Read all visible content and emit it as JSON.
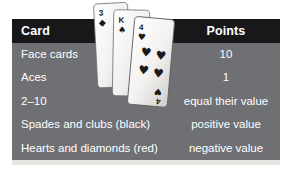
{
  "table": {
    "headers": {
      "card": "Card",
      "points": "Points"
    },
    "rows": [
      {
        "card": "Face cards",
        "points": "10"
      },
      {
        "card": "Aces",
        "points": "1"
      },
      {
        "card": "2–10",
        "points": "equal their value"
      },
      {
        "card": "Spades and clubs (black)",
        "points": "positive value"
      },
      {
        "card": "Hearts and diamonds (red)",
        "points": "negative value"
      }
    ]
  },
  "illustration": {
    "name": "playing-card-stack",
    "cards": [
      {
        "rank": "3",
        "suit": "diamond-pip",
        "suit_glyph": "♦"
      },
      {
        "rank": "K",
        "suit": "spade-pip",
        "suit_glyph": "♠"
      },
      {
        "rank": "4",
        "suit": "heart-pip",
        "suit_glyph": "♥",
        "center_pips": 4
      }
    ]
  },
  "colors": {
    "header_background": "#18181a",
    "row_background": "#6f7073",
    "text": "#ffffff",
    "grid_line": "#d6d6d4",
    "page_background": "#ffffff",
    "card_face": "#f4f4f2",
    "card_pip": "#1a1a1a"
  }
}
